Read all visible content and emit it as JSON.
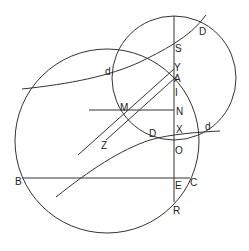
{
  "diagram": {
    "type": "geometric-construction",
    "stroke_color": "#333333",
    "background": "#ffffff",
    "circles": [
      {
        "name": "large-circle",
        "cx": 107,
        "cy": 141,
        "r": 92
      },
      {
        "name": "small-circle",
        "cx": 174,
        "cy": 78,
        "r": 62
      }
    ],
    "labels": [
      {
        "id": "S",
        "text": "S",
        "x": 175,
        "y": 52
      },
      {
        "id": "D_top",
        "text": "D",
        "x": 199,
        "y": 35
      },
      {
        "id": "d_left",
        "text": "d",
        "x": 105,
        "y": 75
      },
      {
        "id": "Y",
        "text": "Y",
        "x": 174,
        "y": 71
      },
      {
        "id": "A",
        "text": "A",
        "x": 174,
        "y": 81
      },
      {
        "id": "I",
        "text": "I",
        "x": 174,
        "y": 94
      },
      {
        "id": "M",
        "text": "M",
        "x": 120,
        "y": 110
      },
      {
        "id": "N",
        "text": "N",
        "x": 175,
        "y": 114
      },
      {
        "id": "D_mid",
        "text": "D",
        "x": 149,
        "y": 137
      },
      {
        "id": "X",
        "text": "X",
        "x": 175,
        "y": 132
      },
      {
        "id": "d_right",
        "text": "d",
        "x": 204,
        "y": 130
      },
      {
        "id": "Z",
        "text": "Z",
        "x": 101,
        "y": 149
      },
      {
        "id": "O",
        "text": "O",
        "x": 175,
        "y": 153
      },
      {
        "id": "B",
        "text": "B",
        "x": 15,
        "y": 185
      },
      {
        "id": "E",
        "text": "E",
        "x": 174,
        "y": 188
      },
      {
        "id": "C",
        "text": "C",
        "x": 190,
        "y": 186
      },
      {
        "id": "R",
        "text": "R",
        "x": 173,
        "y": 213
      }
    ]
  }
}
